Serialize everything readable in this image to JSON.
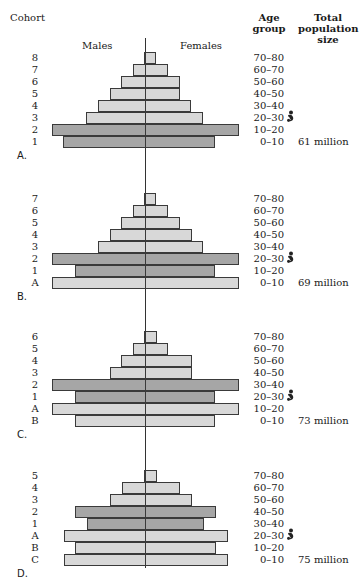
{
  "headers": {
    "cohort": "Cohort",
    "males": "Males",
    "females": "Females",
    "age_group": "Age group",
    "total_population": "Total population size"
  },
  "colors": {
    "light_bar": "#d8d8d8",
    "dark_bar": "#a6a6a6",
    "border": "#3a3a3a"
  },
  "chart_data": [
    {
      "type": "bar",
      "title": "A.",
      "subtype": "population pyramid",
      "total_population": "61 million",
      "baby_icon_age_group": "20–30",
      "rows": [
        {
          "cohort": "8",
          "age": "70–80",
          "male": 1,
          "female": 11,
          "shade": "light"
        },
        {
          "cohort": "7",
          "age": "60–70",
          "male": 12,
          "female": 23,
          "shade": "light"
        },
        {
          "cohort": "6",
          "age": "50–60",
          "male": 24,
          "female": 35,
          "shade": "light"
        },
        {
          "cohort": "5",
          "age": "40–50",
          "male": 35,
          "female": 35,
          "shade": "light"
        },
        {
          "cohort": "4",
          "age": "30–40",
          "male": 47,
          "female": 46,
          "shade": "light"
        },
        {
          "cohort": "3",
          "age": "20–30",
          "male": 59,
          "female": 58,
          "shade": "light"
        },
        {
          "cohort": "2",
          "age": "10–20",
          "male": 93,
          "female": 94,
          "shade": "dark"
        },
        {
          "cohort": "1",
          "age": "0–10",
          "male": 82,
          "female": 70,
          "shade": "dark"
        }
      ]
    },
    {
      "type": "bar",
      "title": "B.",
      "subtype": "population pyramid",
      "total_population": "69 million",
      "baby_icon_age_group": "20–30",
      "rows": [
        {
          "cohort": "7",
          "age": "70–80",
          "male": 1,
          "female": 11,
          "shade": "light"
        },
        {
          "cohort": "6",
          "age": "60–70",
          "male": 12,
          "female": 23,
          "shade": "light"
        },
        {
          "cohort": "5",
          "age": "50–60",
          "male": 24,
          "female": 35,
          "shade": "light"
        },
        {
          "cohort": "4",
          "age": "40–50",
          "male": 35,
          "female": 47,
          "shade": "light"
        },
        {
          "cohort": "3",
          "age": "30–40",
          "male": 47,
          "female": 58,
          "shade": "light"
        },
        {
          "cohort": "2",
          "age": "20–30",
          "male": 93,
          "female": 94,
          "shade": "dark"
        },
        {
          "cohort": "1",
          "age": "10–20",
          "male": 70,
          "female": 70,
          "shade": "dark"
        },
        {
          "cohort": "A",
          "age": "0–10",
          "male": 93,
          "female": 94,
          "shade": "light"
        }
      ]
    },
    {
      "type": "bar",
      "title": "C.",
      "subtype": "population pyramid",
      "total_population": "73 million",
      "baby_icon_age_group": "20–30",
      "rows": [
        {
          "cohort": "6",
          "age": "70–80",
          "male": 1,
          "female": 12,
          "shade": "light"
        },
        {
          "cohort": "5",
          "age": "60–70",
          "male": 12,
          "female": 23,
          "shade": "light"
        },
        {
          "cohort": "4",
          "age": "50–60",
          "male": 24,
          "female": 47,
          "shade": "light"
        },
        {
          "cohort": "3",
          "age": "40–50",
          "male": 35,
          "female": 47,
          "shade": "light"
        },
        {
          "cohort": "2",
          "age": "30–40",
          "male": 93,
          "female": 94,
          "shade": "dark"
        },
        {
          "cohort": "1",
          "age": "20–30",
          "male": 70,
          "female": 70,
          "shade": "dark"
        },
        {
          "cohort": "A",
          "age": "10–20",
          "male": 93,
          "female": 94,
          "shade": "light"
        },
        {
          "cohort": "B",
          "age": "0–10",
          "male": 70,
          "female": 70,
          "shade": "light"
        }
      ]
    },
    {
      "type": "bar",
      "title": "D.",
      "subtype": "population pyramid",
      "total_population": "75 million",
      "baby_icon_age_group": "20–30",
      "rows": [
        {
          "cohort": "5",
          "age": "70–80",
          "male": 1,
          "female": 12,
          "shade": "light"
        },
        {
          "cohort": "4",
          "age": "60–70",
          "male": 23,
          "female": 35,
          "shade": "light"
        },
        {
          "cohort": "3",
          "age": "50–60",
          "male": 35,
          "female": 47,
          "shade": "light"
        },
        {
          "cohort": "2",
          "age": "40–50",
          "male": 70,
          "female": 71,
          "shade": "dark"
        },
        {
          "cohort": "1",
          "age": "30–40",
          "male": 58,
          "female": 59,
          "shade": "dark"
        },
        {
          "cohort": "A",
          "age": "20–30",
          "male": 81,
          "female": 83,
          "shade": "light"
        },
        {
          "cohort": "B",
          "age": "10–20",
          "male": 70,
          "female": 71,
          "shade": "light"
        },
        {
          "cohort": "C",
          "age": "0–10",
          "male": 81,
          "female": 83,
          "shade": "light"
        }
      ]
    }
  ],
  "layout": {
    "center_x": 145,
    "row_height": 12,
    "panel_tops": [
      52,
      193,
      331,
      470
    ],
    "axis_top": 38,
    "axis_bottom": 568
  }
}
